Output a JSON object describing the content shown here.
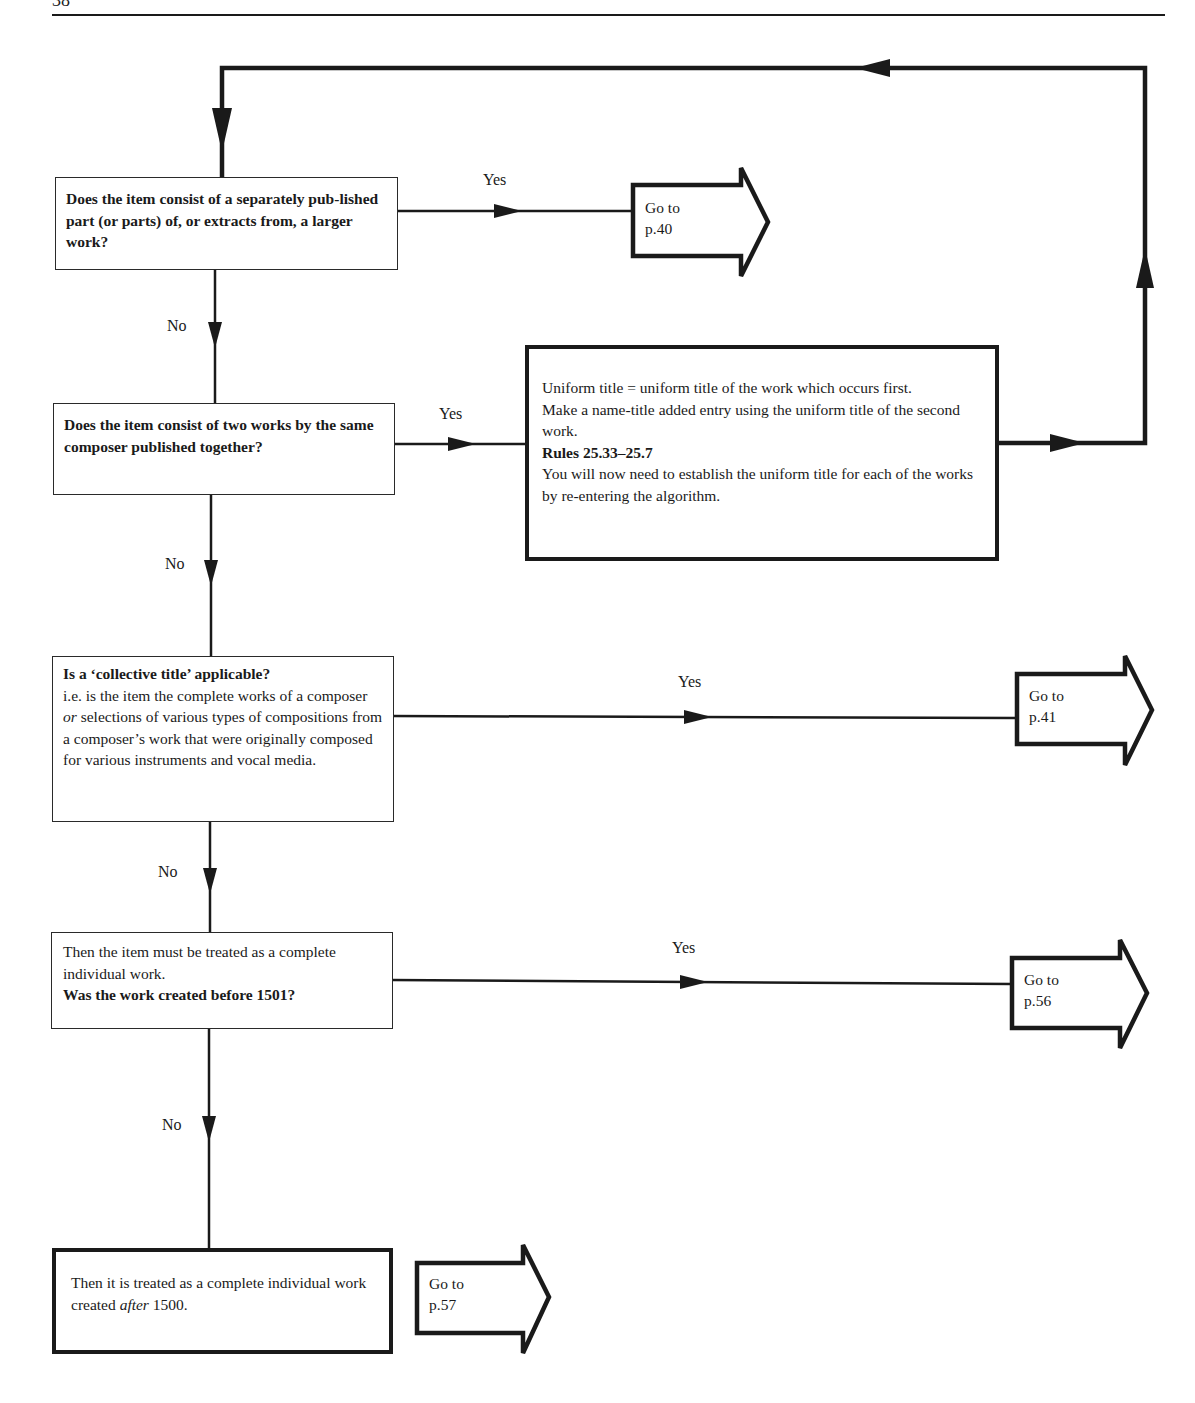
{
  "page": {
    "number": "38"
  },
  "nodes": {
    "q1": {
      "text": "Does the item consist of a separately pub-lished part (or parts) of, or extracts from, a larger work?"
    },
    "q2": {
      "text": "Does the item consist of two works by the same composer published together?"
    },
    "action_two_works": {
      "line1": "Uniform title = uniform title of the work which occurs first.",
      "line2": "Make a name-title added entry using the uniform title of the second work.",
      "rules": "Rules 25.33–25.7",
      "line3": "You will now need to establish the uniform title for each of the works by re-entering the algorithm."
    },
    "q3": {
      "title": "Is a ‘collective title’ applicable?",
      "body_before_or": "i.e. is the item the complete works of a composer ",
      "or": "or",
      "body_after_or": " selections of various types of compositions from a composer’s work that were originally composed for various instruments and vocal media."
    },
    "q4": {
      "intro": "Then the item must be treated as a complete individual work.",
      "question": "Was the work created before 1501?"
    },
    "final": {
      "before": "Then it is treated as a complete individual work created ",
      "em": "after",
      "after": " 1500."
    }
  },
  "gotos": [
    {
      "id": "goto-p40",
      "line1": "Go to",
      "line2": "p.40"
    },
    {
      "id": "goto-p41",
      "line1": "Go to",
      "line2": "p.41"
    },
    {
      "id": "goto-p56",
      "line1": "Go to",
      "line2": "p.56"
    },
    {
      "id": "goto-p57",
      "line1": "Go to",
      "line2": "p.57"
    }
  ],
  "edges": {
    "yes": "Yes",
    "no": "No"
  },
  "colors": {
    "ink": "#1a1a1a",
    "paper": "#ffffff"
  }
}
